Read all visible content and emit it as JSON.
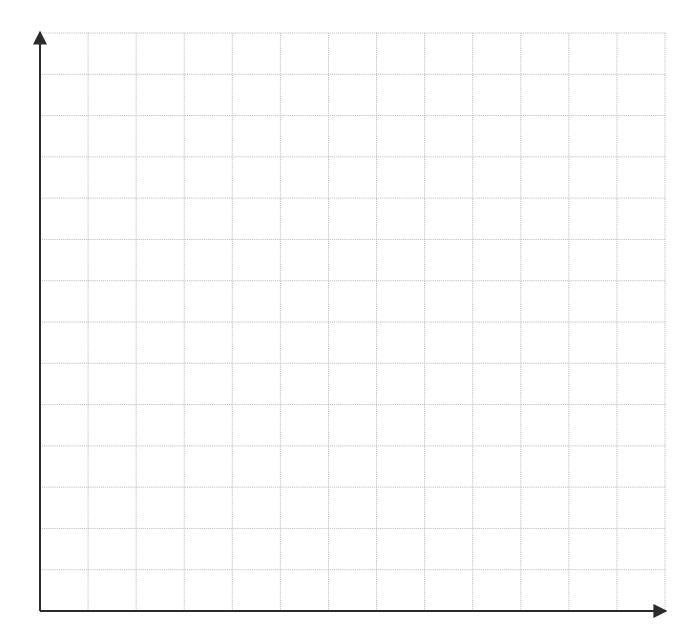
{
  "figure": {
    "type": "blank-coordinate-grid",
    "background_color": "#ffffff",
    "width": 691,
    "height": 640,
    "title": "",
    "caption": ""
  },
  "chart_data": {
    "type": "scatter",
    "title": "",
    "subtitle": "",
    "xlabel": "",
    "ylabel": "",
    "x": [],
    "values": [],
    "series": [],
    "categories": [],
    "tick_labels": {
      "x": [],
      "y": []
    },
    "annotations": [],
    "legend": {
      "entries": [],
      "position": "none",
      "visible": false
    },
    "grid": {
      "visible": true,
      "color": "#b4b4b4",
      "line_width": 1,
      "style": "dotted",
      "columns": 13,
      "rows": 14,
      "cell_width": 48.1,
      "cell_height": 41.3
    },
    "axes": {
      "color": "#2b2b2b",
      "line_width": 2,
      "arrowheads": true,
      "x_axis": {
        "y_pixel": 611,
        "x_start_pixel": 40,
        "x_end_pixel": 666,
        "arrow": "right"
      },
      "y_axis": {
        "x_pixel": 40,
        "y_start_pixel": 611,
        "y_end_pixel": 32,
        "arrow": "up"
      }
    },
    "plot_area": {
      "left": 40,
      "top": 33,
      "right": 665,
      "bottom": 611
    },
    "xlim": [
      0,
      13
    ],
    "ylim": [
      0,
      14
    ]
  }
}
